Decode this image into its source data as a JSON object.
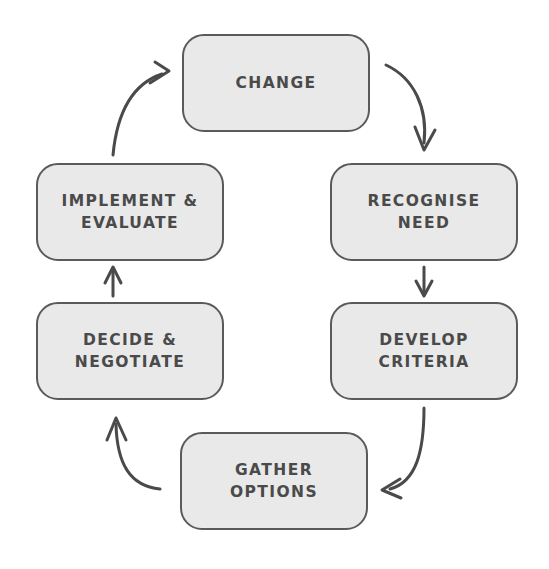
{
  "diagram": {
    "type": "cycle-flowchart",
    "background_color": "#ffffff",
    "node_fill_color": "#e9e9e9",
    "node_border_color": "#5a5a5a",
    "text_color": "#4a4a4a",
    "arrow_color": "#4a4a4a",
    "nodes": [
      {
        "id": "change",
        "label": "CHANGE",
        "position": "top"
      },
      {
        "id": "recognise",
        "label": "RECOGNISE\nNEED",
        "position": "upper-right"
      },
      {
        "id": "develop",
        "label": "DEVELOP\nCRITERIA",
        "position": "lower-right"
      },
      {
        "id": "gather",
        "label": "GATHER\nOPTIONS",
        "position": "bottom"
      },
      {
        "id": "decide",
        "label": "DECIDE &\nNEGOTIATE",
        "position": "lower-left"
      },
      {
        "id": "implement",
        "label": "IMPLEMENT &\nEVALUATE",
        "position": "upper-left"
      }
    ],
    "connections": [
      {
        "id": "change-to-recognise",
        "from": "change",
        "to": "recognise",
        "style": "curved"
      },
      {
        "id": "recognise-to-develop",
        "from": "recognise",
        "to": "develop",
        "style": "straight"
      },
      {
        "id": "develop-to-gather",
        "from": "develop",
        "to": "gather",
        "style": "curved"
      },
      {
        "id": "gather-to-decide",
        "from": "gather",
        "to": "decide",
        "style": "curved"
      },
      {
        "id": "decide-to-implement",
        "from": "decide",
        "to": "implement",
        "style": "straight"
      },
      {
        "id": "implement-to-change",
        "from": "implement",
        "to": "change",
        "style": "curved"
      }
    ]
  }
}
